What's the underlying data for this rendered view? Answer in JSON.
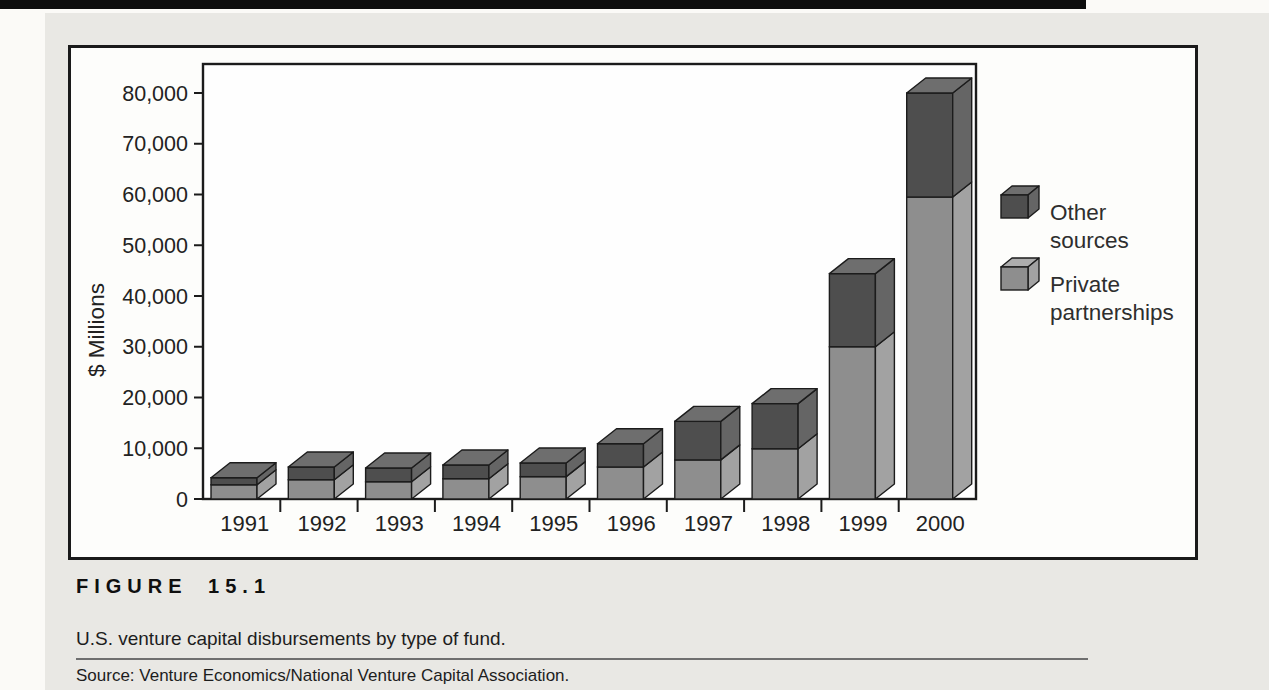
{
  "figure": {
    "label": "FIGURE 15.1",
    "caption": "U.S. venture capital disbursements by type of fund.",
    "source": "Source: Venture Economics/National Venture Capital Association."
  },
  "chart_data": {
    "type": "bar",
    "stacked": true,
    "style": "3d-pseudo",
    "title": "",
    "xlabel": "",
    "ylabel": "$ Millions",
    "units": "$ millions",
    "ylim": [
      0,
      86000
    ],
    "ytick_step": 10000,
    "ytick_labels": [
      "0",
      "10,000",
      "20,000",
      "30,000",
      "40,000",
      "50,000",
      "60,000",
      "70,000",
      "80,000"
    ],
    "categories": [
      "1991",
      "1992",
      "1993",
      "1994",
      "1995",
      "1996",
      "1997",
      "1998",
      "1999",
      "2000"
    ],
    "series": [
      {
        "name": "Private partnerships",
        "values": [
          2800,
          3800,
          3400,
          4000,
          4400,
          6300,
          7700,
          9900,
          30000,
          59500
        ]
      },
      {
        "name": "Other sources",
        "values": [
          1400,
          2500,
          2700,
          2700,
          2700,
          4600,
          7600,
          8900,
          14400,
          20500
        ]
      }
    ],
    "totals": [
      4200,
      6300,
      6100,
      6700,
      7100,
      10900,
      15300,
      18800,
      44400,
      80000
    ],
    "legend": [
      {
        "series": "Other sources",
        "lines": [
          "Other",
          "sources"
        ]
      },
      {
        "series": "Private partnerships",
        "lines": [
          "Private",
          "partnerships"
        ]
      }
    ],
    "legend_position": "right-inside",
    "grid": false
  },
  "colors": {
    "other_front": "#4e4e4e",
    "other_side": "#656565",
    "other_top": "#6e6e6e",
    "private_front": "#8e8e8e",
    "private_side": "#a2a2a2",
    "private_top": "#adadad",
    "bar_edge": "#1c1c1c",
    "axis": "#1b1b1b",
    "text": "#222222",
    "plot_bg": "#fefefe",
    "panel_bg": "#e9e8e4",
    "figure_bg": "#fdfdfb",
    "top_rule": "#0d0d0d",
    "source_rule": "#6f6f6f"
  }
}
